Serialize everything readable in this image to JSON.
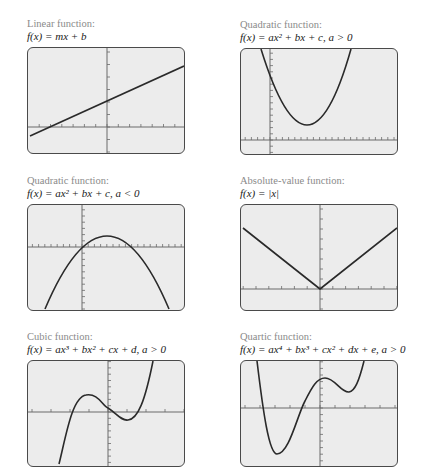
{
  "panels": [
    {
      "id": "linear",
      "title": "Linear function:",
      "formula": "f(x) = mx + b",
      "axes": {
        "x_axis_y": 79,
        "y_axis_x": 79,
        "x_tick_spacing": 11.3,
        "y_tick_spacing": 12.5
      },
      "curve": "M2,88 L156,18"
    },
    {
      "id": "quadratic-pos",
      "title": "Quadratic function:",
      "formula": "f(x) = ax² + bx + c, a > 0",
      "axes": {
        "x_axis_y": 91,
        "y_axis_x": 29,
        "x_tick_spacing": 6.2,
        "y_tick_spacing": 6.2
      },
      "curve": "M20,0 Q67,152 110,0"
    },
    {
      "id": "quadratic-neg",
      "title": "Quadratic function:",
      "formula": "f(x) = ax² + bx + c, a < 0",
      "axes": {
        "x_axis_y": 42,
        "y_axis_x": 54,
        "x_tick_spacing": 6.2,
        "y_tick_spacing": 6.2
      },
      "curve": "M17,104 Q79,-42 141,104"
    },
    {
      "id": "absolute-value",
      "title": "Absolute-value function:",
      "formula": "f(x) = |x|",
      "axes": {
        "x_axis_y": 84,
        "y_axis_x": 79,
        "x_tick_spacing": 12.8,
        "y_tick_spacing": 10
      },
      "curve": "M2,23 L79,84 L156,23"
    },
    {
      "id": "cubic",
      "title": "Cubic function:",
      "formula": "f(x) = ax³ + bx² + cx + d, a > 0",
      "axes": {
        "x_axis_y": 51,
        "y_axis_x": 80,
        "x_tick_spacing": 19,
        "y_tick_spacing": 6.3
      },
      "curve": "M31,103 C38,75 44,36 58,34 C70,32 74,44 80,47 C88,52 93,60 100,59 C110,58 117,40 125,0"
    },
    {
      "id": "quartic",
      "title": "Quartic function:",
      "formula": "f(x) = ax⁴ + bx³ + cx² + dx + e, a > 0",
      "axes": {
        "x_axis_y": 47,
        "y_axis_x": 79,
        "x_tick_spacing": 15,
        "y_tick_spacing": 6.6
      },
      "curve": "M16,0 C22,50 28,93 36,93 C48,93 56,55 64,40 C71,26 76,17 84,17 C94,17 100,32 108,31 C114,30 118,20 123,0"
    }
  ],
  "colors": {
    "screen_fill": "#ececec",
    "screen_border": "#4a4a4a",
    "curve": "#2a2a2a",
    "axis": "#6a6a6a",
    "title": "#8a8a8a",
    "formula": "#1a1a1a"
  }
}
